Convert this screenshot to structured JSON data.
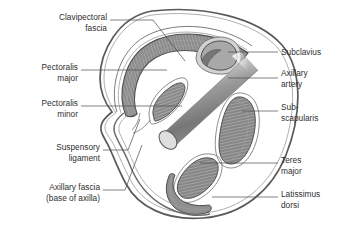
{
  "figure": {
    "background_color": "#ffffff",
    "text_color": "#2f2f2f",
    "leader_color": "#4a4a4a",
    "outline_color": "#5a5a5a",
    "muscle_fill": "#8a8a8a",
    "muscle_fill_light": "#a8a8a8",
    "fascia_fill": "#ffffff",
    "vessel_fill": "#9a9a9a"
  },
  "labels": {
    "left": [
      {
        "id": "clavipectoral-fascia",
        "line1": "Clavipectoral",
        "line2": "fascia",
        "x": 107,
        "y": 22,
        "align": "end",
        "structure": "clavipectoral fascia"
      },
      {
        "id": "pectoralis-major",
        "line1": "Pectoralis",
        "line2": "major",
        "x": 78,
        "y": 72,
        "align": "end",
        "structure": "pectoralis major"
      },
      {
        "id": "pectoralis-minor",
        "line1": "Pectoralis",
        "line2": "minor",
        "x": 78,
        "y": 108,
        "align": "end",
        "structure": "pectoralis minor"
      },
      {
        "id": "suspensory-ligament",
        "line1": "Suspensory",
        "line2": "ligament",
        "x": 100,
        "y": 152,
        "align": "end",
        "structure": "suspensory ligament"
      },
      {
        "id": "axillary-fascia",
        "line1": "Axillary fascia",
        "line2": "(base of axilla)",
        "x": 100,
        "y": 192,
        "align": "end",
        "structure": "axillary fascia"
      }
    ],
    "right": [
      {
        "id": "subclavius",
        "line1": "Subclavius",
        "line2": "",
        "x": 281,
        "y": 54,
        "align": "start",
        "structure": "subclavius"
      },
      {
        "id": "axillary-artery",
        "line1": "Axillary",
        "line2": "artery",
        "x": 281,
        "y": 80,
        "align": "start",
        "structure": "axillary artery"
      },
      {
        "id": "subscapularis",
        "line1": "Sub-",
        "line2": "scapularis",
        "x": 281,
        "y": 113,
        "align": "start",
        "structure": "subscapularis"
      },
      {
        "id": "teres-major",
        "line1": "Teres",
        "line2": "major",
        "x": 281,
        "y": 165,
        "align": "start",
        "structure": "teres major"
      },
      {
        "id": "latissimus-dorsi",
        "line1": "Latissimus",
        "line2": "dorsi",
        "x": 281,
        "y": 199,
        "align": "start",
        "structure": "latissimus dorsi"
      }
    ]
  },
  "structures": [
    {
      "id": "body-outline",
      "name": "axilla cross-section outline"
    },
    {
      "id": "pectoralis-major",
      "name": "pectoralis major muscle band"
    },
    {
      "id": "pectoralis-minor",
      "name": "pectoralis minor muscle"
    },
    {
      "id": "subclavius",
      "name": "subclavius muscle"
    },
    {
      "id": "axillary-artery",
      "name": "axillary artery cylinder"
    },
    {
      "id": "subscapularis",
      "name": "subscapularis muscle"
    },
    {
      "id": "teres-major",
      "name": "teres major muscle"
    },
    {
      "id": "latissimus-dorsi",
      "name": "latissimus dorsi muscle"
    },
    {
      "id": "clavipectoral-fascia",
      "name": "clavipectoral fascia layer"
    },
    {
      "id": "axillary-fascia",
      "name": "axillary fascia band"
    },
    {
      "id": "suspensory-ligament",
      "name": "suspensory ligament of axilla"
    }
  ]
}
